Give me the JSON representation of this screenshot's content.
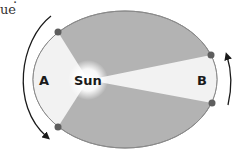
{
  "page_fragment": {
    "text": "ue",
    "dot": "."
  },
  "diagram": {
    "labels": {
      "sun": "Sun",
      "region_a": "A",
      "region_b": "B"
    },
    "colors": {
      "ellipse_fill": "#b3b3b3",
      "ellipse_stroke": "#8a8a8a",
      "sector_fill": "#f2f2f2",
      "dot": "#5e5e5e",
      "arrow": "#1a1a1a",
      "text": "#1a1a1a"
    },
    "ellipse": {
      "cx": 125,
      "cy": 79.5,
      "rx": 92,
      "ry": 68.5
    },
    "sun_position": {
      "x": 88,
      "y": 80
    },
    "planet_positions": [
      {
        "name": "A-top",
        "x": 58,
        "y": 32
      },
      {
        "name": "A-bottom",
        "x": 58,
        "y": 127
      },
      {
        "name": "B-top",
        "x": 211,
        "y": 55
      },
      {
        "name": "B-bottom",
        "x": 212,
        "y": 103
      }
    ],
    "arrows": [
      {
        "name": "arrow-a",
        "direction": "counterclockwise-down"
      },
      {
        "name": "arrow-b",
        "direction": "up"
      }
    ]
  }
}
